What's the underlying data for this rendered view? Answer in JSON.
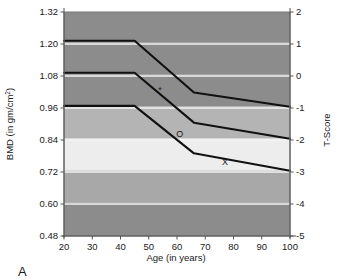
{
  "panel": {
    "label": "A"
  },
  "chart_data": {
    "type": "line",
    "title": "",
    "xlabel": "Age (in years)",
    "ylabel": "BMD (in gm/cm²)",
    "ylabel_main": "BMD (in gm/cm",
    "ylabel_sup": "2",
    "ylabel_tail": ")",
    "y2label": "T-Score",
    "xlim": [
      20,
      100
    ],
    "ylim": [
      0.48,
      1.32
    ],
    "y2lim": [
      -5,
      2
    ],
    "grid": true,
    "legend": "none",
    "xticks": [
      20,
      30,
      40,
      50,
      60,
      70,
      80,
      90,
      100
    ],
    "xticklabels": [
      "20",
      "30",
      "40",
      "50",
      "60",
      "70",
      "80",
      "90",
      "100"
    ],
    "yticks": [
      0.48,
      0.6,
      0.72,
      0.84,
      0.96,
      1.08,
      1.2,
      1.32
    ],
    "yticklabels": [
      "0.48",
      "0.60",
      "0.72",
      "0.84",
      "0.96",
      "1.08",
      "1.20",
      "1.32"
    ],
    "y2ticks": [
      -5,
      -4,
      -3,
      -2,
      -1,
      0,
      1,
      2
    ],
    "y2ticklabels": [
      "-5",
      "-4",
      "-3",
      "-2",
      "-1",
      "0",
      "1",
      "2"
    ],
    "background_bands": [
      {
        "name": "band-t2-to-t1",
        "y_from": 1.32,
        "y_to": 1.205,
        "color": "#8c8c8c"
      },
      {
        "name": "band-t1-to-t0",
        "y_from": 1.205,
        "y_to": 1.085,
        "color": "#8c8c8c"
      },
      {
        "name": "band-t0-to-tm1",
        "y_from": 1.085,
        "y_to": 0.965,
        "color": "#8c8c8c"
      },
      {
        "name": "band-tm1-to-tm2",
        "y_from": 0.965,
        "y_to": 0.845,
        "color": "#b4b4b4"
      },
      {
        "name": "band-tm2-to-tm3",
        "y_from": 0.845,
        "y_to": 0.725,
        "color": "#ededed"
      },
      {
        "name": "band-tm3-to-tm4",
        "y_from": 0.725,
        "y_to": 0.605,
        "color": "#a8a8a8"
      },
      {
        "name": "band-tm4-to-tm5",
        "y_from": 0.605,
        "y_to": 0.48,
        "color": "#8c8c8c"
      }
    ],
    "series": [
      {
        "name": "curve-upper",
        "marker": "*",
        "marker_point": {
          "x": 54,
          "y": 1.025
        },
        "points": [
          {
            "x": 20,
            "y": 1.212
          },
          {
            "x": 45,
            "y": 1.212
          },
          {
            "x": 66,
            "y": 1.018
          },
          {
            "x": 100,
            "y": 0.965
          }
        ]
      },
      {
        "name": "curve-middle",
        "marker": "O",
        "marker_point": {
          "x": 61,
          "y": 0.862
        },
        "points": [
          {
            "x": 20,
            "y": 1.092
          },
          {
            "x": 45,
            "y": 1.092
          },
          {
            "x": 66,
            "y": 0.905
          },
          {
            "x": 100,
            "y": 0.845
          }
        ]
      },
      {
        "name": "curve-lower",
        "marker": "X",
        "marker_point": {
          "x": 77,
          "y": 0.757
        },
        "points": [
          {
            "x": 20,
            "y": 0.968
          },
          {
            "x": 45,
            "y": 0.968
          },
          {
            "x": 66,
            "y": 0.79
          },
          {
            "x": 100,
            "y": 0.725
          }
        ]
      }
    ],
    "colors": {
      "line": "#111111",
      "gridline": "#f2f2f2",
      "axis": "#555555",
      "background": "#ffffff"
    }
  }
}
